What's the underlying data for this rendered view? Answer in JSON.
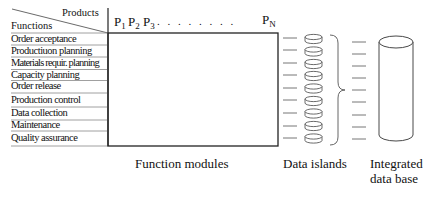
{
  "header": {
    "products_label": "Products",
    "functions_label": "Functions"
  },
  "products": {
    "p1": "P",
    "p1_sub": "1",
    "p2": "P",
    "p2_sub": "2",
    "p3": "P",
    "p3_sub": "3",
    "dots": ". . . . . . . .",
    "pn": "P",
    "pn_sub": "N"
  },
  "functions": [
    "Order acceptance",
    "Productiuon planning",
    "Materials requir. planning",
    "Capacity planning",
    "Order release",
    "Production control",
    "Data collection",
    "Maintenance",
    "Quality assurance"
  ],
  "captions": {
    "function_modules": "Function modules",
    "data_islands": "Data islands",
    "integrated_line1": "Integrated",
    "integrated_line2": "data base"
  }
}
